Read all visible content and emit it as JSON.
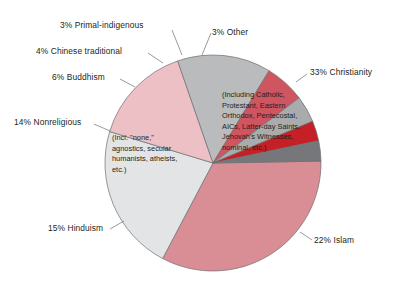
{
  "chart_data": {
    "type": "pie",
    "title": "",
    "subtitle": "",
    "xlabel": "",
    "ylabel": "",
    "legend_position": "none",
    "grid": false,
    "units": "percent",
    "total": 100,
    "categories": [
      "Christianity",
      "Islam",
      "Hinduism",
      "Nonreligious",
      "Buddhism",
      "Chinese traditional",
      "Primal-indigenous",
      "Other"
    ],
    "values": [
      33,
      22,
      15,
      14,
      6,
      4,
      3,
      3
    ],
    "slices": [
      {
        "name": "Christianity",
        "value": 33,
        "label": "33% Christianity",
        "percent_text": "33%",
        "color": "#d98e96",
        "start_angle": -1,
        "end_angle": 117.8,
        "note": "(Including Catholic,\nProtestant, Eastern\nOrthodox, Pentecostal,\nAICs, Latter-day Saints,\nJehovah's Witnesses,\nnominal, etc.)"
      },
      {
        "name": "Islam",
        "value": 22,
        "label": "22% Islam",
        "percent_text": "22%",
        "color": "#e3e4e6",
        "start_angle": 117.8,
        "end_angle": 196.9,
        "note": ""
      },
      {
        "name": "Hinduism",
        "value": 15,
        "label": "15% Hinduism",
        "percent_text": "15%",
        "color": "#edc0c6",
        "start_angle": 196.9,
        "end_angle": 250.9,
        "note": ""
      },
      {
        "name": "Nonreligious",
        "value": 14,
        "label": "14% Nonreligious",
        "percent_text": "14%",
        "color": "#b9bbbd",
        "start_angle": 250.9,
        "end_angle": 301.3,
        "note": "(Incl. \"none,\"\nagnostics, secular\nhumanists, atheists,\netc.)"
      },
      {
        "name": "Buddhism",
        "value": 6,
        "label": "6% Buddhism",
        "percent_text": "6%",
        "color": "#cf5560",
        "start_angle": 301.3,
        "end_angle": 322.9,
        "note": ""
      },
      {
        "name": "Chinese traditional",
        "value": 4,
        "label": "4% Chinese traditional",
        "percent_text": "4%",
        "color": "#a9abad",
        "start_angle": 322.9,
        "end_angle": 337.3,
        "note": ""
      },
      {
        "name": "Primal-indigenous",
        "value": 3,
        "label": "3% Primal-indigenous",
        "percent_text": "3%",
        "color": "#c42026",
        "start_angle": 337.3,
        "end_angle": 348.1,
        "note": ""
      },
      {
        "name": "Other",
        "value": 3,
        "label": "3% Other",
        "percent_text": "3%",
        "color": "#75777a",
        "start_angle": 348.1,
        "end_angle": 359,
        "note": ""
      }
    ]
  },
  "labels": {
    "christianity": "33% Christianity",
    "islam": "22% Islam",
    "hinduism": "15% Hinduism",
    "nonreligious": "14% Nonreligious",
    "buddhism": "6% Buddhism",
    "chinese_traditional": "4% Chinese traditional",
    "primal_indigenous": "3% Primal-indigenous",
    "other": "3% Other"
  },
  "notes": {
    "christianity": "(Including Catholic,\nProtestant, Eastern\nOrthodox, Pentecostal,\nAICs, Latter-day Saints,\nJehovah's Witnesses,\nnominal, etc.)",
    "nonreligious": "(Incl. \"none,\"\nagnostics, secular\nhumanists, atheists,\netc.)"
  },
  "colors": {
    "christianity": "#d98e96",
    "islam": "#e3e4e6",
    "hinduism": "#edc0c6",
    "nonreligious": "#b9bbbd",
    "buddhism": "#cf5560",
    "chinese_traditional": "#a9abad",
    "primal_indigenous": "#c42026",
    "other": "#75777a",
    "text": "#231f20",
    "stroke": "#6f6f6f",
    "background": "#ffffff"
  },
  "geometry": {
    "center_x": 213,
    "center_y": 163,
    "radius": 108
  }
}
